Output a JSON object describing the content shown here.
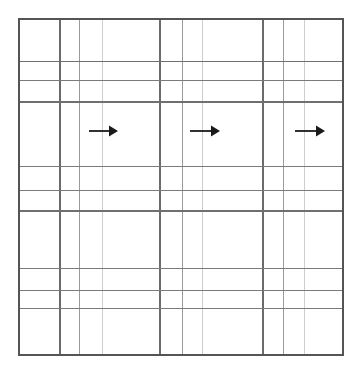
{
  "figure": {
    "background_color": "#ffffff",
    "canvas": {
      "width": 364,
      "height": 376
    }
  },
  "grid": {
    "border": {
      "x0": 19,
      "y0": 19,
      "x1": 343,
      "y1": 355,
      "color": "#555555",
      "width": 1.6
    },
    "vertical_lines": [
      {
        "x": 60,
        "color": "#6b6b6b",
        "width": 1.2
      },
      {
        "x": 79,
        "color": "#8f8f8f",
        "width": 0.9
      },
      {
        "x": 102,
        "color": "#c2c2c2",
        "width": 0.8
      },
      {
        "x": 160,
        "color": "#6b6b6b",
        "width": 1.2
      },
      {
        "x": 182,
        "color": "#8f8f8f",
        "width": 0.9
      },
      {
        "x": 202,
        "color": "#c2c2c2",
        "width": 0.8
      },
      {
        "x": 263,
        "color": "#6b6b6b",
        "width": 1.2
      },
      {
        "x": 283,
        "color": "#8f8f8f",
        "width": 0.9
      },
      {
        "x": 304,
        "color": "#c2c2c2",
        "width": 0.8
      }
    ],
    "horizontal_lines": [
      {
        "y": 61,
        "color": "#6f6f6f",
        "width": 1.0
      },
      {
        "y": 80,
        "color": "#7a7a7a",
        "width": 1.0
      },
      {
        "y": 102,
        "color": "#6f6f6f",
        "width": 1.1
      },
      {
        "y": 166,
        "color": "#7a7a7a",
        "width": 1.0
      },
      {
        "y": 190,
        "color": "#7a7a7a",
        "width": 1.0
      },
      {
        "y": 211,
        "color": "#6f6f6f",
        "width": 1.1
      },
      {
        "y": 268,
        "color": "#7a7a7a",
        "width": 1.0
      },
      {
        "y": 290,
        "color": "#7a7a7a",
        "width": 1.0
      },
      {
        "y": 308,
        "color": "#7a7a7a",
        "width": 1.0
      }
    ],
    "column_count": 10,
    "row_count": 10
  },
  "arrows": [
    {
      "name": "arrow-right-1",
      "direction": "right",
      "x_start": 89,
      "x_end": 118,
      "y": 131,
      "shaft_width": 1.8,
      "head_length": 9,
      "head_half_height": 5.5,
      "color": "#1a1a1a"
    },
    {
      "name": "arrow-right-2",
      "direction": "right",
      "x_start": 190,
      "x_end": 220,
      "y": 131,
      "shaft_width": 1.8,
      "head_length": 9,
      "head_half_height": 5.5,
      "color": "#1a1a1a"
    },
    {
      "name": "arrow-right-3",
      "direction": "right",
      "x_start": 295,
      "x_end": 325,
      "y": 131,
      "shaft_width": 1.8,
      "head_length": 9,
      "head_half_height": 5.5,
      "color": "#1a1a1a"
    }
  ],
  "chart_data": {
    "type": "table",
    "title": "",
    "xlabel": "",
    "ylabel": "",
    "columns": [],
    "rows": [],
    "annotations": [
      {
        "label": "→",
        "cell_row": 4,
        "cell_col": 3,
        "meaning": "rightward arrow"
      },
      {
        "label": "→",
        "cell_row": 4,
        "cell_col": 6,
        "meaning": "rightward arrow"
      },
      {
        "label": "→",
        "cell_row": 4,
        "cell_col": 9,
        "meaning": "rightward arrow"
      }
    ]
  }
}
